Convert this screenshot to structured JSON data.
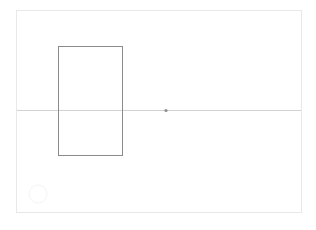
{
  "app": {
    "title": "Canvas",
    "background_color": "#ffffff"
  },
  "artboard": {
    "name": "artboard",
    "x": 16,
    "y": 10,
    "width": 286,
    "height": 203,
    "border_color": "#e8e8e8",
    "fill_color": "#ffffff"
  },
  "shapes": [
    {
      "id": "rectangle-1",
      "type": "rectangle",
      "x": 58,
      "y": 46,
      "width": 64,
      "height": 109,
      "stroke_color": "#8a8a8a",
      "stroke_width": 1,
      "fill": "none"
    },
    {
      "id": "guide-line-horizontal",
      "type": "line",
      "x1": 17,
      "y1": 110.5,
      "x2": 301,
      "y2": 110.5,
      "stroke_color": "#d2d2d2",
      "stroke_width": 1
    },
    {
      "id": "anchor-point-1",
      "type": "point",
      "cx": 166,
      "cy": 110.5,
      "radius": 1.6,
      "fill_color": "#8f8f8f"
    },
    {
      "id": "circle-1",
      "type": "circle",
      "cx": 38,
      "cy": 194,
      "radius": 9,
      "stroke_color": "#f4f4f4",
      "stroke_width": 1,
      "fill": "none"
    }
  ]
}
